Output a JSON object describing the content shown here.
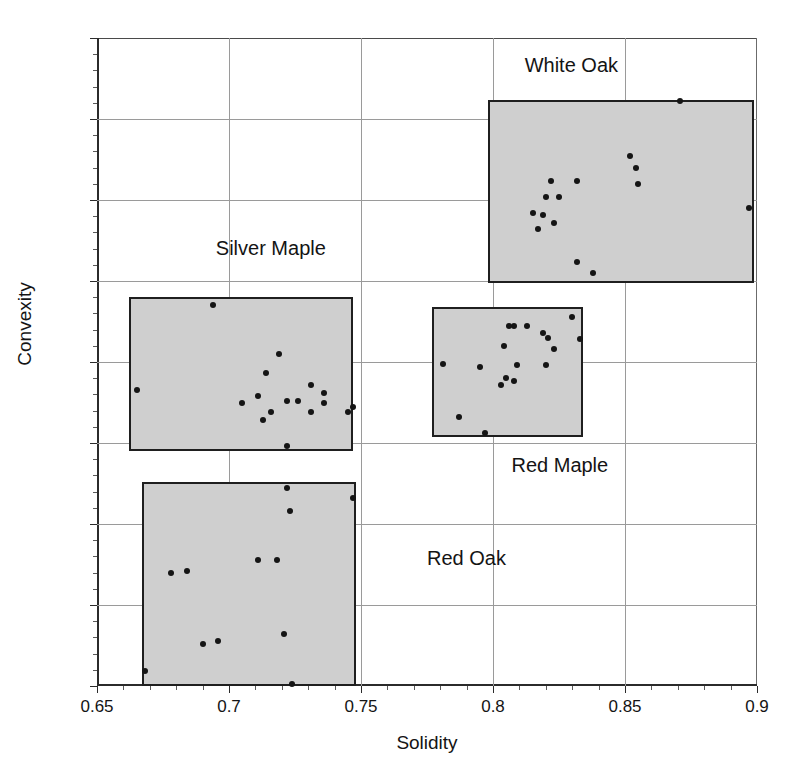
{
  "figure": {
    "title": "",
    "background": "#ffffff",
    "box_fill": "#cfcfcf",
    "box_stroke": "#1f1f1f",
    "point_color": "#151515",
    "grid_color": "#9a9a9a"
  },
  "chart_data": {
    "type": "scatter",
    "title": "",
    "xlabel": "Solidity",
    "ylabel": "Convexity",
    "xlim": [
      0.65,
      0.9
    ],
    "ylim": [
      0.5,
      0.9
    ],
    "xticks": [
      0.65,
      0.7,
      0.75,
      0.8,
      0.85,
      0.9
    ],
    "xticklabels": [
      "0.65",
      "0.7",
      "0.75",
      "0.8",
      "0.85",
      "0.9"
    ],
    "yticks": [
      0.5,
      0.55,
      0.6,
      0.65,
      0.7,
      0.75,
      0.8,
      0.85,
      0.9
    ],
    "yticklabels": [
      "0.5",
      "0.55",
      "0.6",
      "0.65",
      "0.7",
      "0.75",
      "0.8",
      "0.85",
      "0.9"
    ],
    "grid": true,
    "legend": "none",
    "annotations": [
      "White Oak",
      "Silver Maple",
      "Red Maple",
      "Red Oak"
    ],
    "series": [
      {
        "name": "White Oak",
        "label_text": "White Oak",
        "label_x": 0.812,
        "label_y": 0.882,
        "box": {
          "x0": 0.798,
          "x1": 0.899,
          "y0": 0.749,
          "y1": 0.862
        },
        "points": [
          [
            0.871,
            0.861
          ],
          [
            0.852,
            0.827
          ],
          [
            0.854,
            0.82
          ],
          [
            0.855,
            0.81
          ],
          [
            0.822,
            0.812
          ],
          [
            0.832,
            0.812
          ],
          [
            0.82,
            0.802
          ],
          [
            0.825,
            0.802
          ],
          [
            0.815,
            0.792
          ],
          [
            0.819,
            0.791
          ],
          [
            0.823,
            0.786
          ],
          [
            0.817,
            0.782
          ],
          [
            0.897,
            0.795
          ],
          [
            0.832,
            0.762
          ],
          [
            0.838,
            0.755
          ]
        ]
      },
      {
        "name": "Silver Maple",
        "label_text": "Silver Maple",
        "label_x": 0.695,
        "label_y": 0.769,
        "box": {
          "x0": 0.662,
          "x1": 0.747,
          "y0": 0.645,
          "y1": 0.74
        },
        "points": [
          [
            0.694,
            0.735
          ],
          [
            0.719,
            0.705
          ],
          [
            0.714,
            0.693
          ],
          [
            0.665,
            0.683
          ],
          [
            0.731,
            0.686
          ],
          [
            0.736,
            0.681
          ],
          [
            0.736,
            0.675
          ],
          [
            0.705,
            0.675
          ],
          [
            0.711,
            0.679
          ],
          [
            0.722,
            0.676
          ],
          [
            0.726,
            0.676
          ],
          [
            0.716,
            0.669
          ],
          [
            0.731,
            0.669
          ],
          [
            0.747,
            0.672
          ],
          [
            0.713,
            0.664
          ],
          [
            0.745,
            0.669
          ],
          [
            0.722,
            0.648
          ]
        ]
      },
      {
        "name": "Red Maple",
        "label_text": "Red Maple",
        "label_x": 0.807,
        "label_y": 0.635,
        "box": {
          "x0": 0.777,
          "x1": 0.834,
          "y0": 0.654,
          "y1": 0.734
        },
        "points": [
          [
            0.806,
            0.722
          ],
          [
            0.808,
            0.722
          ],
          [
            0.813,
            0.722
          ],
          [
            0.819,
            0.718
          ],
          [
            0.821,
            0.715
          ],
          [
            0.83,
            0.728
          ],
          [
            0.833,
            0.714
          ],
          [
            0.804,
            0.71
          ],
          [
            0.823,
            0.708
          ],
          [
            0.781,
            0.699
          ],
          [
            0.795,
            0.697
          ],
          [
            0.809,
            0.698
          ],
          [
            0.82,
            0.698
          ],
          [
            0.805,
            0.69
          ],
          [
            0.808,
            0.688
          ],
          [
            0.803,
            0.686
          ],
          [
            0.787,
            0.666
          ],
          [
            0.797,
            0.656
          ]
        ]
      },
      {
        "name": "Red Oak",
        "label_text": "Red Oak",
        "label_x": 0.775,
        "label_y": 0.578,
        "box": {
          "x0": 0.667,
          "x1": 0.748,
          "y0": 0.5,
          "y1": 0.626
        },
        "points": [
          [
            0.722,
            0.622
          ],
          [
            0.747,
            0.616
          ],
          [
            0.723,
            0.608
          ],
          [
            0.711,
            0.578
          ],
          [
            0.718,
            0.578
          ],
          [
            0.678,
            0.57
          ],
          [
            0.684,
            0.571
          ],
          [
            0.69,
            0.526
          ],
          [
            0.696,
            0.528
          ],
          [
            0.721,
            0.532
          ],
          [
            0.668,
            0.509
          ],
          [
            0.724,
            0.501
          ]
        ]
      }
    ]
  }
}
